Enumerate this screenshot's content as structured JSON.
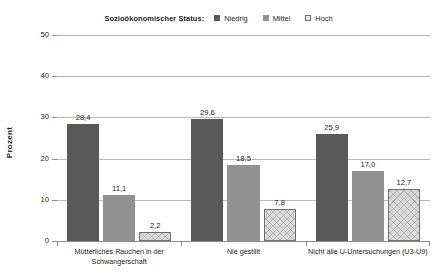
{
  "chart_data": {
    "type": "bar",
    "title": "",
    "xlabel": "",
    "ylabel": "Prozent",
    "ylim": [
      0,
      50
    ],
    "yticks": [
      0,
      10,
      20,
      30,
      40,
      50
    ],
    "ytick_labels": [
      "0",
      "10",
      "20",
      "30",
      "40",
      "50"
    ],
    "grid": "horizontal",
    "legend_position": "top-center",
    "legend_title": "Sozioökonomischer Status:",
    "categories": [
      "Mütterliches Rauchen in der Schwangerschaft",
      "Nie gestillt",
      "Nicht alle U-Untersuchungen (U3-U9)"
    ],
    "category_lines": [
      [
        "Mütterliches Rauchen in der",
        "Schwangerschaft"
      ],
      [
        "Nie gestillt"
      ],
      [
        "Nicht alle U-Untersuchungen (U3-U9)"
      ]
    ],
    "series": [
      {
        "name": "Niedrig",
        "color": "#595959",
        "values": [
          28.4,
          29.6,
          25.9
        ],
        "labels": [
          "28,4",
          "29,6",
          "25,9"
        ]
      },
      {
        "name": "Mittel",
        "color": "#919191",
        "values": [
          11.1,
          18.5,
          17.0
        ],
        "labels": [
          "11,1",
          "18,5",
          "17,0"
        ]
      },
      {
        "name": "Hoch",
        "color": "#d9d9d9",
        "values": [
          2.2,
          7.8,
          12.7
        ],
        "labels": [
          "2,2",
          "7,8",
          "12,7"
        ]
      }
    ]
  }
}
